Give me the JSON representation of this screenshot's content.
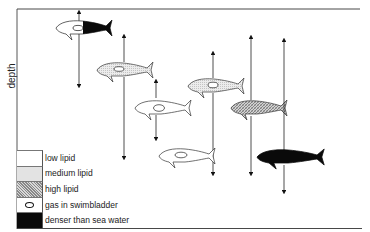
{
  "diagram": {
    "axis": {
      "y_label": "depth"
    },
    "legend": [
      {
        "key": "low",
        "label": "low lipid",
        "fill": "#ffffff"
      },
      {
        "key": "medium",
        "label": "medium lipid",
        "fill": "#e3e3e3"
      },
      {
        "key": "high",
        "label": "high lipid",
        "fill": "hatched-grey"
      },
      {
        "key": "gas",
        "label": "gas in swimbladder",
        "fill": "open-ellipse"
      },
      {
        "key": "dense",
        "label": "denser than sea water",
        "fill": "#0a0a0a"
      }
    ],
    "fish": [
      {
        "id": "fish-1",
        "composition": "low lipid + gas in swimbladder front, denser than sea water rear",
        "depth_range": "surface to mid"
      },
      {
        "id": "fish-2",
        "composition": "medium lipid + gas in swimbladder",
        "depth_range": "upper to lower-mid"
      },
      {
        "id": "fish-3",
        "composition": "low lipid + gas in swimbladder",
        "depth_range": "mid"
      },
      {
        "id": "fish-4",
        "composition": "medium lipid + gas in swimbladder",
        "depth_range": "upper-mid to lower"
      },
      {
        "id": "fish-5",
        "composition": "high lipid",
        "depth_range": "upper to lower"
      },
      {
        "id": "fish-6",
        "composition": "low lipid + gas in swimbladder",
        "depth_range": "deep"
      },
      {
        "id": "fish-7",
        "composition": "denser than sea water",
        "depth_range": "upper to deep"
      }
    ],
    "colors": {
      "line": "#222222",
      "black_fill": "#0a0a0a",
      "medium_fill": "#e3e3e3",
      "high_fill": "#b5b5b5"
    }
  }
}
